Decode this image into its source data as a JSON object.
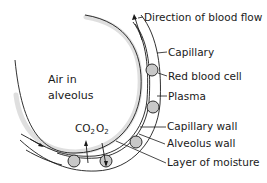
{
  "diagram": {
    "region_label": {
      "line1": "Air in",
      "line2": "alveolus"
    },
    "gases": [
      {
        "name": "CO",
        "subscript": "2",
        "direction": "out-of-blood"
      },
      {
        "name": "O",
        "subscript": "2",
        "direction": "into-blood"
      }
    ],
    "labels": [
      {
        "id": "direction-of-blood-flow",
        "text": "Direction of blood flow"
      },
      {
        "id": "capillary",
        "text": "Capillary"
      },
      {
        "id": "red-blood-cell",
        "text": "Red blood cell"
      },
      {
        "id": "plasma",
        "text": "Plasma"
      },
      {
        "id": "capillary-wall",
        "text": "Capillary wall"
      },
      {
        "id": "alveolus-wall",
        "text": "Alveolus wall"
      },
      {
        "id": "layer-of-moisture",
        "text": "Layer of moisture"
      }
    ],
    "colors": {
      "line": "#1a1a1a",
      "cell_fill": "#c8c8c8",
      "moisture_stipple": "#d9d9d9"
    }
  }
}
